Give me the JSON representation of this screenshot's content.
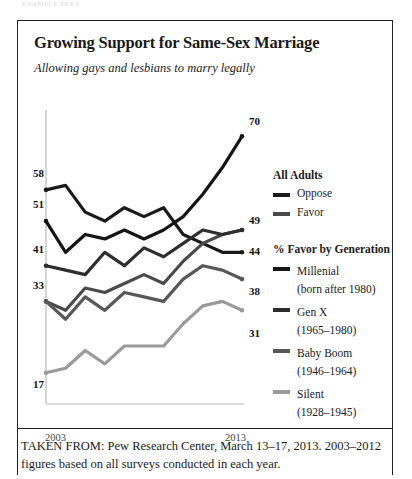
{
  "running_head": "EXAMPLE TEXT",
  "figure": {
    "title": "Growing Support for Same-Sex Marriage",
    "subtitle": "Allowing gays and lesbians to marry legally"
  },
  "legend": {
    "group1_heading": "All Adults",
    "group2_heading": "% Favor by Generation",
    "entries": [
      {
        "label": "Oppose",
        "sub": "",
        "color": "#1a1a1a"
      },
      {
        "label": "Favor",
        "sub": "",
        "color": "#4a4a4a"
      },
      {
        "label": "Millenial",
        "sub": "(born after 1980)",
        "color": "#151515"
      },
      {
        "label": "Gen X",
        "sub": "(1965–1980)",
        "color": "#2e2e2e"
      },
      {
        "label": "Baby Boom",
        "sub": "(1946–1964)",
        "color": "#585858"
      },
      {
        "label": "Silent",
        "sub": "(1928–1945)",
        "color": "#9a9a9a"
      }
    ]
  },
  "axis": {
    "x_start": "2003",
    "x_end": "2013"
  },
  "footer": "TAKEN FROM: Pew Research Center, March 13–17, 2013. 2003–2012 figures based on all surveys conducted in each year.",
  "chart_data": {
    "type": "line",
    "title": "Growing Support for Same-Sex Marriage",
    "subtitle": "Allowing gays and lesbians to marry legally",
    "xlabel": "",
    "ylabel": "",
    "x": [
      2003,
      2004,
      2005,
      2006,
      2007,
      2008,
      2009,
      2010,
      2011,
      2012,
      2013
    ],
    "xlim": [
      2003,
      2013
    ],
    "ylim": [
      10,
      75
    ],
    "grid": false,
    "legend_position": "right",
    "series": [
      {
        "name": "Oppose",
        "group": "All Adults",
        "color": "#1a1a1a",
        "start_label": 58,
        "end_label": 44,
        "values": [
          58,
          59,
          53,
          51,
          54,
          52,
          54,
          48,
          46,
          44,
          44
        ]
      },
      {
        "name": "Favor",
        "group": "All Adults",
        "color": "#4a4a4a",
        "start_label": 33,
        "end_label": 49,
        "values": [
          33,
          31,
          36,
          35,
          37,
          39,
          37,
          42,
          46,
          48,
          49
        ]
      },
      {
        "name": "Millenial",
        "group": "% Favor by Generation",
        "sub": "(born after 1980)",
        "color": "#151515",
        "start_label": 51,
        "end_label": 70,
        "values": [
          51,
          44,
          48,
          47,
          49,
          47,
          49,
          52,
          57,
          63,
          70
        ]
      },
      {
        "name": "Gen X",
        "group": "% Favor by Generation",
        "sub": "(1965–1980)",
        "color": "#2e2e2e",
        "start_label": 41,
        "end_label": 49,
        "values": [
          41,
          40,
          39,
          44,
          41,
          45,
          43,
          46,
          49,
          48,
          49
        ]
      },
      {
        "name": "Baby Boom",
        "group": "% Favor by Generation",
        "sub": "(1946–1964)",
        "color": "#585858",
        "start_label": 33,
        "end_label": 38,
        "values": [
          33,
          29,
          34,
          31,
          35,
          34,
          33,
          38,
          41,
          40,
          38
        ]
      },
      {
        "name": "Silent",
        "group": "% Favor by Generation",
        "sub": "(1928–1945)",
        "color": "#9a9a9a",
        "start_label": 17,
        "end_label": 31,
        "values": [
          17,
          18,
          22,
          19,
          23,
          23,
          23,
          28,
          32,
          33,
          31
        ]
      }
    ],
    "point_labels": {
      "left": [
        58,
        51,
        41,
        33,
        17
      ],
      "right": [
        70,
        49,
        44,
        38,
        31
      ]
    }
  }
}
